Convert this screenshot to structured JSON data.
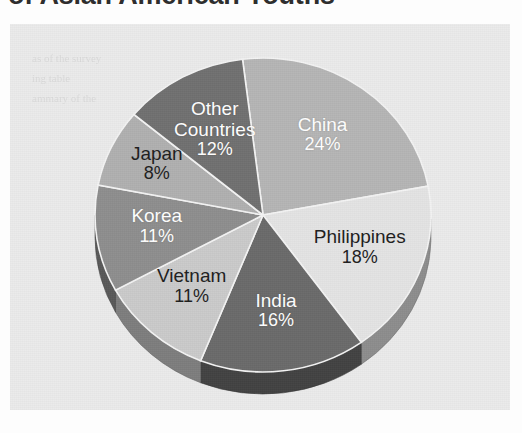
{
  "title": {
    "text": "of Asian American Youths",
    "note_cut_off": true
  },
  "panel": {
    "background_color": "#ebebeb",
    "ghost_text": [
      "as of the survey",
      "ing table",
      "ammary of the"
    ]
  },
  "chart_data": {
    "type": "pie",
    "title": "of Asian American Youths",
    "xlabel": "",
    "ylabel": "",
    "legend_position": "none",
    "labels_inside_slices": true,
    "three_d": true,
    "categories": [
      "China",
      "Philippines",
      "India",
      "Vietnam",
      "Korea",
      "Japan",
      "Other Countries"
    ],
    "values": [
      24,
      18,
      16,
      11,
      11,
      8,
      12
    ],
    "value_suffix": "%",
    "slices": [
      {
        "label": "China",
        "value": 24,
        "display": "24%",
        "color": "#b5b5b5",
        "text_color": "#ffffff"
      },
      {
        "label": "Philippines",
        "value": 18,
        "display": "18%",
        "color": "#e4e4e4",
        "text_color": "#1d1d1d"
      },
      {
        "label": "India",
        "value": 16,
        "display": "16%",
        "color": "#6a6a6a",
        "text_color": "#ffffff"
      },
      {
        "label": "Vietnam",
        "value": 11,
        "display": "11%",
        "color": "#cacaca",
        "text_color": "#1d1d1d"
      },
      {
        "label": "Korea",
        "value": 11,
        "display": "11%",
        "color": "#8e8e8e",
        "text_color": "#ffffff"
      },
      {
        "label": "Japan",
        "value": 8,
        "display": "8%",
        "color": "#b0b0b0",
        "text_color": "#1d1d1d"
      },
      {
        "label": "Other Countries",
        "value": 12,
        "display": "12%",
        "color": "#707070",
        "text_color": "#ffffff"
      }
    ]
  }
}
